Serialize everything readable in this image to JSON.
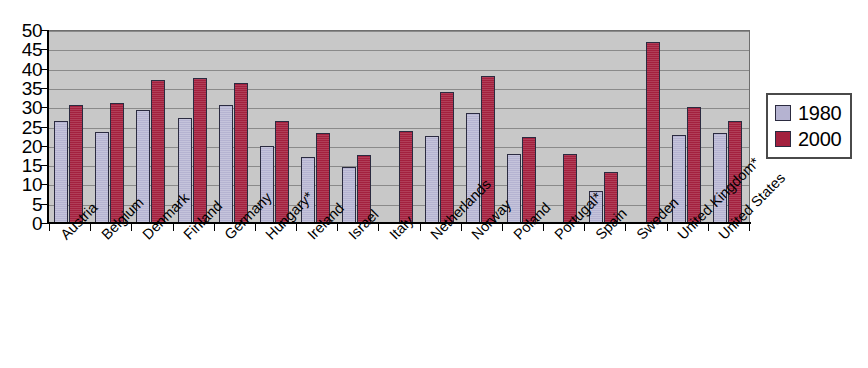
{
  "chart_data": {
    "type": "bar",
    "title": "",
    "subtitle": "",
    "xlabel": "",
    "ylabel": "",
    "ylim": [
      0,
      50
    ],
    "ytick_step": 5,
    "yticks": [
      "50",
      "45",
      "40",
      "35",
      "30",
      "25",
      "20",
      "15",
      "10",
      "5",
      "0"
    ],
    "grid": true,
    "grid_axis": "y",
    "legend_position": "right",
    "categories": [
      "Austria",
      "Belgium",
      "Denmark",
      "Finland",
      "Germany",
      "Hungary*",
      "Ireland",
      "Israel",
      "Italy",
      "Netherlands",
      "Norway",
      "Poland",
      "Portugal*",
      "Spain",
      "Sweden",
      "United Kingdom*",
      "United States"
    ],
    "series": [
      {
        "name": "1980",
        "color": "#b5b3d1",
        "values": [
          26.3,
          23.5,
          29.3,
          27.2,
          30.6,
          19.9,
          17.2,
          14.5,
          null,
          22.5,
          28.5,
          17.8,
          null,
          8.4,
          null,
          22.8,
          23.4
        ]
      },
      {
        "name": "2000",
        "color": "#a3203e",
        "values": [
          30.7,
          31.1,
          37.1,
          37.6,
          36.4,
          26.5,
          23.2,
          17.7,
          23.8,
          33.9,
          38.0,
          22.3,
          17.9,
          13.2,
          47.0,
          30.0,
          26.3
        ]
      }
    ]
  },
  "legend": {
    "entries": [
      {
        "label": "1980",
        "color": "#b5b3d1"
      },
      {
        "label": "2000",
        "color": "#a3203e"
      }
    ]
  },
  "colors": {
    "series_1980": "#b5b3d1",
    "series_2000": "#a3203e",
    "plot_background": "#c8c8c8",
    "gridline": "#8a8a8a",
    "axis": "#000000",
    "bar_outline": "#2b2b40",
    "page_background": "#ffffff"
  }
}
